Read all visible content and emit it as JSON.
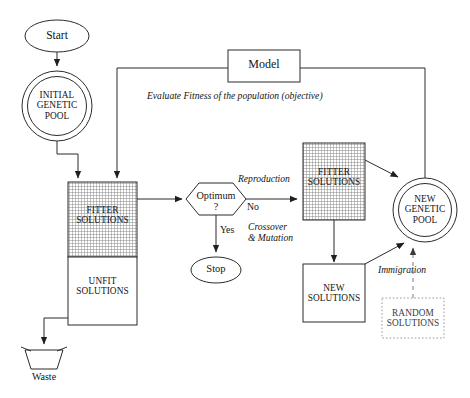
{
  "diagram": {
    "caption_partial": "",
    "colors": {
      "stroke": "#2b2b2b",
      "text": "#141414",
      "hatch": "#777777",
      "background": "#ffffff",
      "dashed": "#9a9a9a"
    }
  },
  "nodes": {
    "start": {
      "label": "Start",
      "shape": "ellipse"
    },
    "initial_pool": {
      "label": "INITIAL\nGENETIC\nPOOL",
      "shape": "double-circle"
    },
    "fitter_left": {
      "label": "FITTER\nSOLUTIONS",
      "shape": "hatched-rect"
    },
    "unfit_left": {
      "label": "UNFIT\nSOLUTIONS",
      "shape": "rect"
    },
    "waste": {
      "label": "Waste",
      "shape": "trapezoid"
    },
    "optimum": {
      "label": "Optimum\n?",
      "shape": "hexagon"
    },
    "stop": {
      "label": "Stop",
      "shape": "ellipse"
    },
    "model": {
      "label": "Model",
      "shape": "rect"
    },
    "fitter_right": {
      "label": "FITTER\nSOLUTIONS",
      "shape": "hatched-rect"
    },
    "new_pool": {
      "label": "NEW\nGENETIC\nPOOL",
      "shape": "double-circle"
    },
    "new_solutions": {
      "label": "NEW\nSOLUTIONS",
      "shape": "rect"
    },
    "random_solutions": {
      "label": "RANDOM\nSOLUTIONS",
      "shape": "dotted-rect"
    }
  },
  "edge_labels": {
    "evaluate": "Evaluate Fitness of the population (objective)",
    "reproduction": "Reproduction",
    "no": "No",
    "yes": "Yes",
    "crossover": "Crossover\n& Mutation",
    "immigration": "Immigration"
  }
}
